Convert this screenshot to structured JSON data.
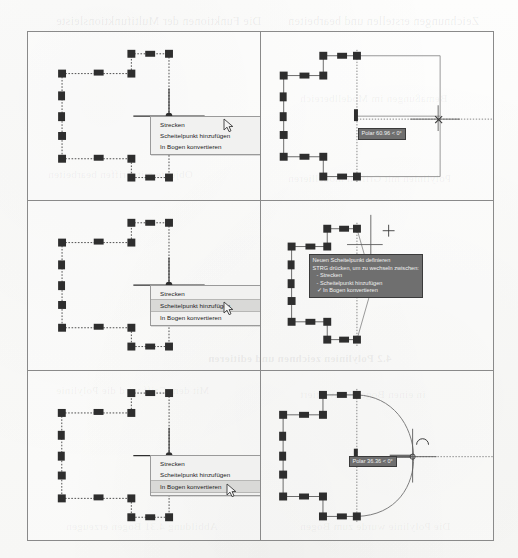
{
  "figure": {
    "kind": "cad-screenshot-grid",
    "rows": 3,
    "columns": 2
  },
  "menu": {
    "items": [
      {
        "label": "Strecken"
      },
      {
        "label": "Scheitelpunkt hinzufügen"
      },
      {
        "label": "In Bogen konvertieren"
      }
    ]
  },
  "panels": {
    "p1": {
      "name": "top-left",
      "selected_menu_index": -1,
      "menu": [
        "Strecken",
        "Scheitelpunkt hinzufügen",
        "In Bogen konvertieren"
      ]
    },
    "p2": {
      "name": "top-right",
      "tooltip": "Polar 60.96 < 0°"
    },
    "p3": {
      "name": "middle-left",
      "selected_menu_index": 1,
      "menu": [
        "Strecken",
        "Scheitelpunkt hinzufügen",
        "In Bogen konvertieren"
      ]
    },
    "p4": {
      "name": "middle-right",
      "tooltip_title": "Neuen Scheitelpunkt definieren",
      "tooltip_hint": "STRG drücken, um zu wechseln zwischen:",
      "tooltip_options": [
        "- Strecken",
        "- Scheitelpunkt hinzufügen",
        "✓ In Bogen konvertieren"
      ]
    },
    "p5": {
      "name": "bottom-left",
      "selected_menu_index": 2,
      "menu": [
        "Strecken",
        "Scheitelpunkt hinzufügen",
        "In Bogen konvertieren"
      ]
    },
    "p6": {
      "name": "bottom-right",
      "tooltip": "Polar 36.36 < 0°"
    }
  },
  "showthrough": {
    "lines": [
      {
        "text": "Die Funktionen der Multifunktionsleiste",
        "x": 56,
        "y": 14,
        "size": 12,
        "bold": false
      },
      {
        "text": "Zeichnungen erstellen und bearbeiten",
        "x": 288,
        "y": 14,
        "size": 12,
        "bold": false
      },
      {
        "text": "Bemaßungen im Modellbereich",
        "x": 300,
        "y": 92,
        "size": 11,
        "bold": false
      },
      {
        "text": "Objekte mit Griffen bearbeiten",
        "x": 48,
        "y": 168,
        "size": 11,
        "bold": false
      },
      {
        "text": "Polylinien mit Griffen modellieren",
        "x": 288,
        "y": 172,
        "size": 11,
        "bold": false
      },
      {
        "text": "4.2 Polylinien zeichnen und editieren",
        "x": 208,
        "y": 352,
        "size": 11,
        "bold": true
      },
      {
        "text": "Mit dem Griff wird die Polylinie",
        "x": 56,
        "y": 384,
        "size": 11,
        "bold": false
      },
      {
        "text": "in einen Bogen konvertiert",
        "x": 300,
        "y": 388,
        "size": 11,
        "bold": false
      },
      {
        "text": "Abbildung 4.31 Bogen erzeugen",
        "x": 66,
        "y": 520,
        "size": 11,
        "bold": false
      },
      {
        "text": "Die Polylinie wurde zum Bogen",
        "x": 300,
        "y": 520,
        "size": 11,
        "bold": false
      }
    ]
  },
  "colors": {
    "paper": "#fbfbfa",
    "grid_border": "#8a8a8a",
    "grip": "#2e2e2e",
    "polyline": "#4a4a4a",
    "dotted_guide": "#6e6e6e",
    "menu_bg": "#f1f1f0",
    "menu_selected": "#d9d9d7",
    "tooltip_bg": "#6f6f6f",
    "tooltip_text": "#f0f0f0"
  }
}
